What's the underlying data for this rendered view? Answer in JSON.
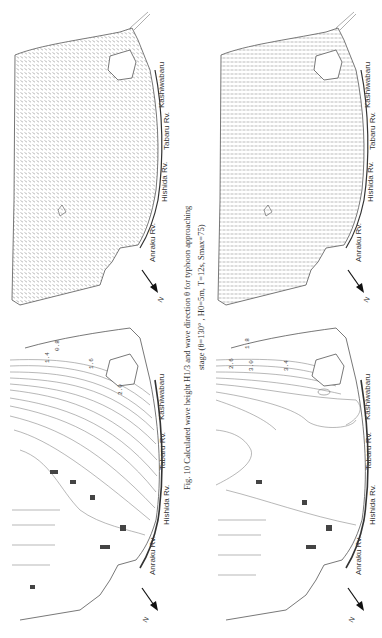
{
  "figure": {
    "number": "Fig. 10",
    "caption_line1": "Fig. 10  Calculated wave height H1/3 and wave direction θ   for typhoon approaching",
    "caption_line2": "stage  (θ=130° ,  H0=5m, T=12s, Smax=75)"
  },
  "panels": [
    {
      "id": "top-left",
      "type": "wave-direction-vectors"
    },
    {
      "id": "top-right",
      "type": "wave-direction-vectors"
    },
    {
      "id": "bottom-left",
      "type": "wave-height-contours"
    },
    {
      "id": "bottom-right",
      "type": "wave-height-contours"
    }
  ],
  "labels": {
    "kashiwabaru": "Kashiwabaru",
    "tabaru": "Tabaru Rv.",
    "hishida": "Hishida Rv.",
    "anraku": "Anraku Rv.",
    "north": "N"
  },
  "contour_labels": {
    "bottom_left": [
      "0.8",
      "1.4",
      "1.6",
      "1.6",
      "2.0",
      "2.0",
      "0.8"
    ],
    "bottom_right": [
      "1.8",
      "0.8",
      "2.6",
      "3.0",
      "3.4",
      "2.6",
      "0.8"
    ]
  }
}
